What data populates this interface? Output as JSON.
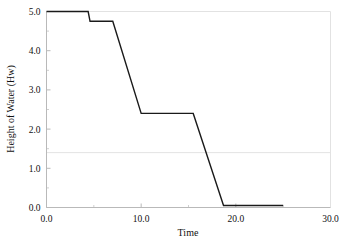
{
  "chart_data": {
    "type": "line",
    "title": "",
    "subtitle": "",
    "xlabel": "Time",
    "ylabel": "Height of Water (Hw)",
    "xlim": [
      0.0,
      30.0
    ],
    "ylim": [
      0.0,
      5.0
    ],
    "grid": false,
    "legend": null,
    "legend_position": "none",
    "x_ticks": [
      0.0,
      10.0,
      20.0,
      30.0
    ],
    "x_tick_labels": [
      "0.0",
      "10.0",
      "20.0",
      "30.0"
    ],
    "x_minor_ticks": [
      5.0,
      15.0,
      25.0
    ],
    "y_ticks": [
      0.0,
      1.0,
      2.0,
      3.0,
      4.0,
      5.0
    ],
    "y_tick_labels": [
      "0.0",
      "1.0",
      "2.0",
      "3.0",
      "4.0",
      "5.0"
    ],
    "y_minor_ticks": [
      0.5,
      1.5,
      2.5,
      3.5,
      4.5
    ],
    "series": [
      {
        "name": "Height of Water (Hw)",
        "color": "#1a1a1a",
        "line_width": 1.4,
        "x": [
          0.0,
          4.4,
          4.6,
          7.0,
          10.0,
          15.5,
          18.7,
          25.0
        ],
        "y": [
          5.0,
          5.0,
          4.75,
          4.75,
          2.4,
          2.4,
          0.05,
          0.05
        ]
      }
    ],
    "annotations": [
      {
        "name": "reference-line",
        "type": "hline",
        "value": 1.4,
        "color": "#dcdcdc",
        "line_width": 0.8
      }
    ]
  },
  "axes": {
    "frame_color": "#b9b9b9",
    "tick_color": "#b9b9b9",
    "background": "#ffffff"
  }
}
